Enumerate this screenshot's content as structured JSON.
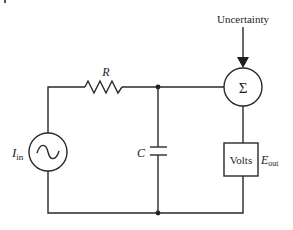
{
  "diagram": {
    "type": "circuit",
    "labels": {
      "uncertainty": "Uncertainty",
      "resistor": "R",
      "capacitor": "C",
      "source_main": "I",
      "source_sub": "in",
      "sum_symbol": "Σ",
      "meter": "Volts",
      "output_main": "E",
      "output_sub": "out"
    },
    "components": [
      {
        "id": "source",
        "kind": "AC current source",
        "label": "I_in"
      },
      {
        "id": "resistor",
        "kind": "resistor",
        "label": "R"
      },
      {
        "id": "capacitor",
        "kind": "capacitor",
        "label": "C"
      },
      {
        "id": "summer",
        "kind": "summing junction",
        "label": "Σ",
        "input": "Uncertainty"
      },
      {
        "id": "voltmeter",
        "kind": "meter",
        "label": "Volts",
        "output": "E_out"
      }
    ],
    "colors": {
      "line": "#2a2a2a",
      "text": "#1e1e1e",
      "background": "#ffffff"
    }
  }
}
